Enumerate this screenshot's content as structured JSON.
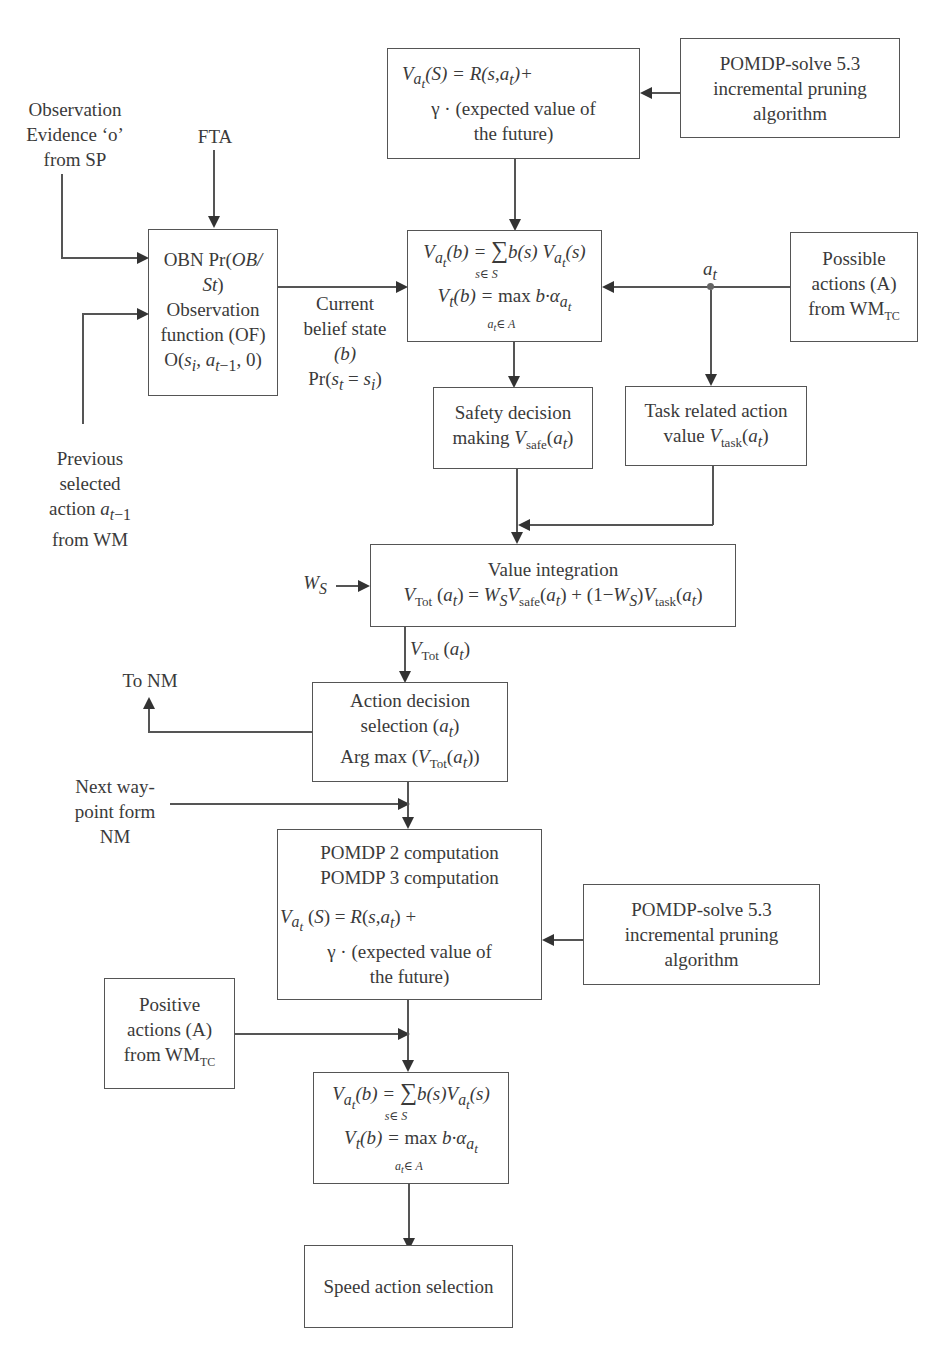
{
  "diagram": {
    "type": "flowchart",
    "nodes": {
      "value_function_top": {
        "line1": "V_{a_t}(S) = R(s,a_t)+",
        "line2": "γ · (expected value of",
        "line3": "the future)"
      },
      "pomdp_solve_top": {
        "line1": "POMDP-solve 5.3",
        "line2": "incremental pruning",
        "line3": "algorithm"
      },
      "observation_evidence": {
        "line1": "Observation",
        "line2": "Evidence ‘o’",
        "line3": "from SP"
      },
      "fta": {
        "text": "FTA"
      },
      "obn_box": {
        "line1": "OBN Pr(OB/",
        "line2": "St)",
        "line3": "Observation",
        "line4": "function (OF)",
        "line5": "O(s_i, a_{t−1}, 0)"
      },
      "current_belief": {
        "line1": "Current",
        "line2": "belief state",
        "line3": "(b)",
        "line4": "Pr(s_t = s_i)"
      },
      "belief_value_box": {
        "line1": "V_{a_t}(b) = Σ_{s∈S} b(s) V_{a_t}(s)",
        "line2": "V_t(b) = max_{a_t∈A} b·α_{a_t}"
      },
      "at_label": {
        "text": "a_t"
      },
      "possible_actions": {
        "line1": "Possible",
        "line2": "actions (A)",
        "line3": "from WM_TC"
      },
      "safety_decision": {
        "line1": "Safety decision",
        "line2": "making V_safe(a_t)"
      },
      "task_related": {
        "line1": "Task related action",
        "line2": "value V_task(a_t)"
      },
      "previous_action": {
        "line1": "Previous",
        "line2": "selected",
        "line3": "action a_{t−1}",
        "line4": "from WM"
      },
      "ws_label": {
        "text": "W_S"
      },
      "value_integration": {
        "line1": "Value integration",
        "line2": "V_Tot (a_t) = W_S V_safe(a_t) + (1−W_S) V_task(a_t)"
      },
      "vtot_label": {
        "text": "V_Tot (a_t)"
      },
      "to_nm": {
        "text": "To NM"
      },
      "action_decision": {
        "line1": "Action decision",
        "line2": "selection (a_t)",
        "line3": "Arg max (V_Tot(a_t))"
      },
      "next_waypoint": {
        "line1": "Next way-",
        "line2": "point form",
        "line3": "NM"
      },
      "pomdp_computation": {
        "line1": "POMDP 2 computation",
        "line2": "POMDP 3 computation",
        "line3": "V_{a_t}(S) = R(s,a_t) +",
        "line4": "γ · (expected value of",
        "line5": "the future)"
      },
      "pomdp_solve_bottom": {
        "line1": "POMDP-solve 5.3",
        "line2": "incremental pruning",
        "line3": "algorithm"
      },
      "positive_actions": {
        "line1": "Positive",
        "line2": "actions (A)",
        "line3": "from WM_TC"
      },
      "belief_value_box_bottom": {
        "line1": "V_{a_t}(b) = Σ_{s∈S} b(s) V_{a_t}(s)",
        "line2": "V_t(b) = max_{a_t∈A} b·α_{a_t}"
      },
      "speed_action": {
        "text": "Speed action selection"
      }
    }
  }
}
